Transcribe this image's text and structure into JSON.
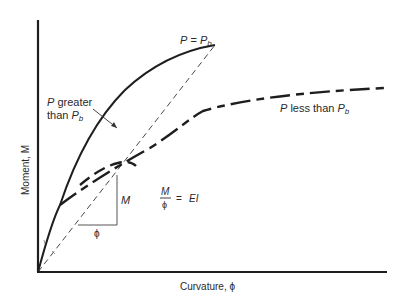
{
  "figure": {
    "type": "moment-curvature diagram",
    "axes": {
      "xlabel": "Curvature, ϕ",
      "ylabel": "Moment, M"
    },
    "curves": [
      {
        "name": "P = Pb",
        "style": "solid",
        "label_main": "P",
        "label_eq": " = ",
        "label_sub_base": "P",
        "label_sub": "b"
      },
      {
        "name": "P less than Pb",
        "style": "long-dash",
        "label_main": "P",
        "label_mid": " less than ",
        "label_sub_base": "P",
        "label_sub": "b"
      },
      {
        "name": "P greater than Pb",
        "style": "dashed",
        "label_line1_main": "P",
        "label_line1_rest": " greater",
        "label_line2_pre": "than ",
        "label_line2_base": "P",
        "label_line2_sub": "b"
      },
      {
        "name": "secant stiffness line",
        "style": "thin-dashed"
      }
    ],
    "slope_triangle": {
      "rise_label": "M",
      "run_label": "ϕ"
    },
    "equation": {
      "numerator": "M",
      "denominator": "ϕ",
      "equals": "=",
      "rhs": "EI"
    },
    "colors": {
      "ink": "#1e1e1e",
      "background": "#ffffff"
    }
  }
}
